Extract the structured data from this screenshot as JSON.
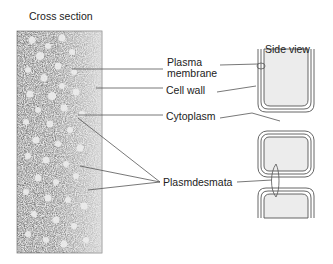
{
  "diagram": {
    "cross_section_title": "Cross section",
    "side_view_title": "Side view",
    "labels": {
      "plasma_membrane_line1": "Plasma",
      "plasma_membrane_line2": "membrane",
      "cell_wall": "Cell wall",
      "cytoplasm": "Cytoplasm",
      "plasmodesmata": "Plasmdesmata"
    }
  }
}
